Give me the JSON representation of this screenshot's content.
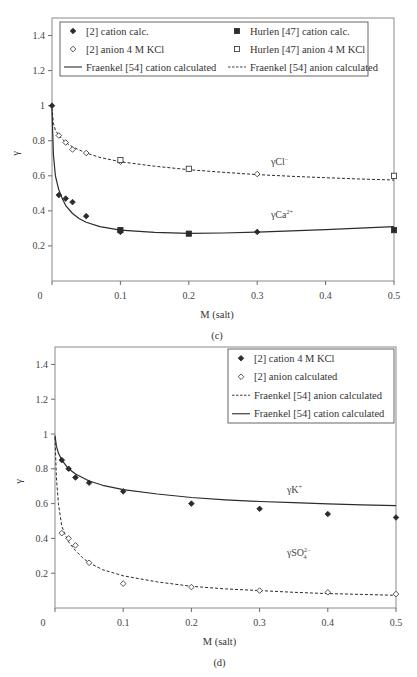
{
  "chart_data": [
    {
      "id": "c",
      "type": "scatter",
      "panel_label": "(c)",
      "title": "",
      "xlabel": "M (salt)",
      "ylabel": "γ",
      "xlim": [
        0,
        0.5
      ],
      "ylim": [
        0,
        1.5
      ],
      "xticks": [
        0,
        0.1,
        0.2,
        0.3,
        0.4,
        0.5
      ],
      "xtick_labels": [
        "0",
        "0.1",
        "0.2",
        "0.3",
        "0.4",
        "0.5"
      ],
      "yticks": [
        0.2,
        0.4,
        0.6,
        0.8,
        1.0,
        1.2,
        1.4
      ],
      "ytick_labels": [
        "0.2",
        "0.4",
        "0.6",
        "0.8",
        "1",
        "1.2",
        "1.4"
      ],
      "grid": false,
      "legend_position": "top",
      "annotations": [
        {
          "text": "γCl",
          "sup": "−",
          "x": 0.32,
          "y": 0.66
        },
        {
          "text": "γCa",
          "sup": "2+",
          "x": 0.32,
          "y": 0.36
        }
      ],
      "series": [
        {
          "name": "[2] cation calc.",
          "kind": "points",
          "marker": "diamond-filled",
          "x": [
            0.0,
            0.01,
            0.02,
            0.03,
            0.05,
            0.1,
            0.1,
            0.3
          ],
          "y": [
            1.0,
            0.49,
            0.47,
            0.45,
            0.37,
            0.29,
            0.28,
            0.28
          ]
        },
        {
          "name": "[2] anion 4 M KCl",
          "kind": "points",
          "marker": "diamond-open",
          "x": [
            0.01,
            0.02,
            0.03,
            0.05,
            0.1,
            0.3
          ],
          "y": [
            0.83,
            0.79,
            0.75,
            0.73,
            0.68,
            0.61
          ]
        },
        {
          "name": "Hurlen [47] cation calc.",
          "kind": "points",
          "marker": "square-filled",
          "x": [
            0.1,
            0.2,
            0.5
          ],
          "y": [
            0.29,
            0.27,
            0.29
          ]
        },
        {
          "name": "Hurlen [47] anion 4 M KCl",
          "kind": "points",
          "marker": "square-open",
          "x": [
            0.1,
            0.2,
            0.5
          ],
          "y": [
            0.69,
            0.64,
            0.6
          ]
        },
        {
          "name": "Fraenkel [54] cation calculated",
          "kind": "line",
          "dash": "solid",
          "x": [
            0.0,
            0.002,
            0.005,
            0.01,
            0.015,
            0.02,
            0.03,
            0.04,
            0.05,
            0.07,
            0.1,
            0.15,
            0.2,
            0.25,
            0.3,
            0.35,
            0.4,
            0.45,
            0.5
          ],
          "y": [
            0.98,
            0.72,
            0.6,
            0.52,
            0.47,
            0.43,
            0.385,
            0.355,
            0.335,
            0.31,
            0.29,
            0.278,
            0.272,
            0.274,
            0.279,
            0.286,
            0.293,
            0.301,
            0.31
          ]
        },
        {
          "name": "Fraenkel [54] anion calculated",
          "kind": "line",
          "dash": "dashed",
          "x": [
            0.0,
            0.002,
            0.005,
            0.01,
            0.02,
            0.03,
            0.05,
            0.07,
            0.1,
            0.15,
            0.2,
            0.25,
            0.3,
            0.35,
            0.4,
            0.45,
            0.5
          ],
          "y": [
            0.99,
            0.9,
            0.86,
            0.83,
            0.79,
            0.765,
            0.73,
            0.705,
            0.68,
            0.655,
            0.635,
            0.62,
            0.607,
            0.597,
            0.589,
            0.582,
            0.576
          ]
        }
      ]
    },
    {
      "id": "d",
      "type": "scatter",
      "panel_label": "(d)",
      "title": "",
      "xlabel": "M (salt)",
      "ylabel": "γ",
      "xlim": [
        0,
        0.5
      ],
      "ylim": [
        0,
        1.5
      ],
      "xticks": [
        0,
        0.1,
        0.2,
        0.3,
        0.4,
        0.5
      ],
      "xtick_labels": [
        "0",
        "0.1",
        "0.2",
        "0.3",
        "0.4",
        "0.5"
      ],
      "yticks": [
        0.2,
        0.4,
        0.6,
        0.8,
        1.0,
        1.2,
        1.4
      ],
      "ytick_labels": [
        "0.2",
        "0.4",
        "0.6",
        "0.8",
        "1",
        "1.2",
        "1.4"
      ],
      "grid": false,
      "legend_position": "top-right",
      "annotations": [
        {
          "text": "γK",
          "sup": "+",
          "x": 0.34,
          "y": 0.66
        },
        {
          "text": "γSO",
          "sup": "2−",
          "sub": "4",
          "x": 0.34,
          "y": 0.3
        }
      ],
      "series": [
        {
          "name": "[2] cation 4 M KCl",
          "kind": "points",
          "marker": "diamond-filled",
          "x": [
            0.01,
            0.02,
            0.03,
            0.05,
            0.1,
            0.2,
            0.3,
            0.4,
            0.5
          ],
          "y": [
            0.85,
            0.8,
            0.75,
            0.72,
            0.67,
            0.6,
            0.57,
            0.54,
            0.52
          ]
        },
        {
          "name": "[2] anion calculated",
          "kind": "points",
          "marker": "diamond-open",
          "x": [
            0.01,
            0.02,
            0.03,
            0.05,
            0.1,
            0.2,
            0.3,
            0.4,
            0.5
          ],
          "y": [
            0.43,
            0.4,
            0.36,
            0.26,
            0.14,
            0.12,
            0.1,
            0.09,
            0.08
          ]
        },
        {
          "name": "Fraenkel [54] anion calculated",
          "kind": "line",
          "dash": "dashed",
          "x": [
            0.0,
            0.002,
            0.005,
            0.01,
            0.015,
            0.02,
            0.03,
            0.04,
            0.05,
            0.07,
            0.1,
            0.15,
            0.2,
            0.25,
            0.3,
            0.35,
            0.4,
            0.45,
            0.5
          ],
          "y": [
            0.98,
            0.75,
            0.6,
            0.47,
            0.42,
            0.38,
            0.33,
            0.29,
            0.26,
            0.22,
            0.185,
            0.15,
            0.125,
            0.11,
            0.1,
            0.09,
            0.083,
            0.078,
            0.073
          ]
        },
        {
          "name": "Fraenkel [54] cation calculated",
          "kind": "line",
          "dash": "solid",
          "x": [
            0.0,
            0.002,
            0.005,
            0.01,
            0.02,
            0.03,
            0.05,
            0.07,
            0.1,
            0.15,
            0.2,
            0.25,
            0.3,
            0.35,
            0.4,
            0.45,
            0.5
          ],
          "y": [
            0.99,
            0.93,
            0.89,
            0.85,
            0.8,
            0.77,
            0.73,
            0.705,
            0.68,
            0.655,
            0.635,
            0.622,
            0.612,
            0.605,
            0.598,
            0.593,
            0.588
          ]
        }
      ]
    }
  ],
  "panels": {
    "c": {
      "frame": {
        "left": 52,
        "top": 18,
        "right": 394,
        "bottom": 281
      },
      "origin_label": "0",
      "legend": {
        "box": {
          "x": 60,
          "y": 22,
          "w": 308,
          "h": 54
        },
        "entries": [
          {
            "label": "[2] cation calc.",
            "marker": "diamond-filled",
            "col": 0,
            "row": 0
          },
          {
            "label": "Hurlen [47] cation calc.",
            "marker": "square-filled",
            "col": 1,
            "row": 0
          },
          {
            "label": "[2] anion 4 M KCl",
            "marker": "diamond-open",
            "col": 0,
            "row": 1
          },
          {
            "label": "Hurlen [47] anion 4 M KCl",
            "marker": "square-open",
            "col": 1,
            "row": 1
          },
          {
            "label": "Fraenkel [54] cation calculated",
            "marker": "line-solid",
            "col": 0,
            "row": 2
          },
          {
            "label": "Fraenkel [54] anion calculated",
            "marker": "line-dashed",
            "col": 1,
            "row": 2
          }
        ]
      }
    },
    "d": {
      "frame": {
        "left": 55,
        "top": 347,
        "right": 396,
        "bottom": 608
      },
      "origin_label": "0",
      "legend": {
        "box": {
          "x": 228,
          "y": 349,
          "w": 166,
          "h": 74
        },
        "entries": [
          {
            "label": "[2] cation 4 M KCl",
            "marker": "diamond-filled",
            "col": 0,
            "row": 0
          },
          {
            "label": "[2] anion calculated",
            "marker": "diamond-open",
            "col": 0,
            "row": 1
          },
          {
            "label": "Fraenkel [54] anion calculated",
            "marker": "line-dashed",
            "col": 0,
            "row": 2
          },
          {
            "label": "Fraenkel [54] cation calculated",
            "marker": "line-solid",
            "col": 0,
            "row": 3
          }
        ]
      }
    }
  },
  "colors": {
    "ink": "#2b2b2b",
    "axis": "#6a6a6a",
    "frame": "#8a8a8a",
    "legend_border": "#555555"
  }
}
